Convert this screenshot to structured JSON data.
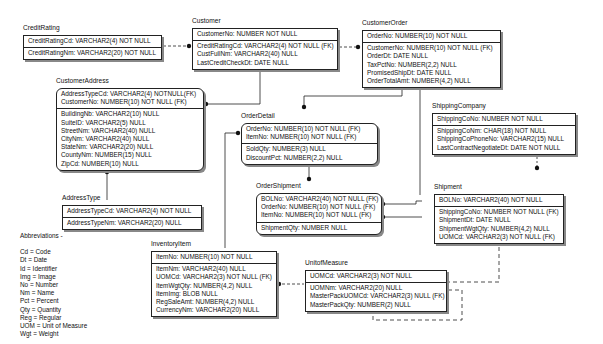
{
  "diagram": {
    "type": "entity-relationship",
    "entities": {
      "credit_rating": {
        "name": "CreditRating",
        "keys": [
          "CreditRatingCd: VARCHAR2(4) NOT NULL"
        ],
        "attributes": [
          "CreditRatingNm: VARCHAR2(20) NOT NULL"
        ]
      },
      "customer": {
        "name": "Customer",
        "keys": [
          "CustomerNo: NUMBER NOT NULL"
        ],
        "attributes": [
          "CreditRatingCd: VARCHAR2(4) NOT NULL (FK)",
          "CustFullNm: VARCHAR2(40) NULL",
          "LastCreditCheckDt: DATE NULL"
        ]
      },
      "customer_order": {
        "name": "CustomerOrder",
        "keys": [
          "OrderNo: NUMBER(10) NOT NULL"
        ],
        "attributes": [
          "CustomerNo: NUMBER(10) NOT NULL (FK)",
          "OrderDt: DATE NULL",
          "TaxPctNo: NUMBER(2,2) NULL",
          "PromisedShipDt: DATE NULL",
          "OrderTotalAmt: NUMBER(4,2) NULL"
        ]
      },
      "customer_address": {
        "name": "CustomerAddress",
        "keys": [
          "AddressTypeCd: VARCHAR2(4) NOTNULL(FK)",
          "CustomerNo: NUMBER(10) NOT NULL (FK)"
        ],
        "attributes": [
          "BuildingNb: VARCHAR2(10) NULL",
          "SuiteID: VARCHAR2(5) NULL",
          "StreetNm: VARCHAR2(40) NULL",
          "CityNm: VARCHAR2(40) NULL",
          "StateNm: VARCHAR2(20) NULL",
          "CountyNm: NUMBER(15) NULL",
          "ZipCd: NUMBER(10) NULL"
        ]
      },
      "order_detail": {
        "name": "OrderDetail",
        "keys": [
          "OrderNo: NUMBER(10) NOT NULL (FK)",
          "ItemNo: NUMBER(10) NOT NULL (FK)"
        ],
        "attributes": [
          "SoldQty: NUMBER(3) NULL",
          "DiscountPct: NUMBER(2,2) NULL"
        ]
      },
      "shipping_company": {
        "name": "ShippingCompany",
        "keys": [
          "ShippingCoNo: NUMBER NOT NULL"
        ],
        "attributes": [
          "ShippingCoNm: CHAR(18) NOT NULL",
          "ShippingCoPhoneNo: VARCHAR2(15) NULL",
          "LastContractNegotiateDt: DATE NOT NULL"
        ]
      },
      "address_type": {
        "name": "AddressType",
        "keys": [
          "AddressTypeCd: VARCHAR2(4) NOT NULL"
        ],
        "attributes": [
          "AddressTypeNm: VARCHAR2(20) NULL"
        ]
      },
      "order_shipment": {
        "name": "OrderShipment",
        "keys": [
          "BOLNo: VARCHAR2(40) NOT NULL (FK)",
          "OrderNo: NUMBER(10) NOT NULL (FK)",
          "ItemNo: NUMBER(10) NOT NULL (FK)"
        ],
        "attributes": [
          "ShipmentQty: NUMBER NULL"
        ]
      },
      "shipment": {
        "name": "Shipment",
        "keys": [
          "BOLNo: VARCHAR2(40) NOT NULL"
        ],
        "attributes": [
          "ShippingCoNo: NUMBER NOT NULL (FK)",
          "ShipmentDt: DATE NULL",
          "ShipmentWgtQty: NUMBER(4,2) NULL",
          "UOMCd: VARCHAR2(3) NOT NULL (FK)"
        ]
      },
      "inventory_item": {
        "name": "InventoryItem",
        "keys": [
          "ItemNo: NUMBER(10) NOT NULL"
        ],
        "attributes": [
          "ItemNm: VARCHAR2(40) NULL",
          "UOMCd: VARCHAR2(3) NOT NULL (FK)",
          "ItemWgtQty: NUMBER(4,2) NULL",
          "ItemImg: BLOB NULL",
          "RegSaleAmt: NUMBER(4,2) NULL",
          "CurrencyNm: VARCHAR2(20) NULL"
        ]
      },
      "unit_of_measure": {
        "name": "UnitofMeasure",
        "keys": [
          "UOMCd: VARCHAR2(3) NOT NULL"
        ],
        "attributes": [
          "UOMNm: VARCHAR2(20) NULL",
          "MasterPackUOMCd: VARCHAR2(3) NULL (FK)",
          "MasterPackQty: NUMBER(2) NULL"
        ]
      }
    },
    "abbreviations": {
      "title": "Abbreviations -",
      "items": [
        "Cd = Code",
        "Dt = Date",
        "Id = Identifier",
        "Img = Image",
        "No = Number",
        "Nm = Name",
        "Pct = Percent",
        "Qty = Quantity",
        "Reg = Regular",
        "UOM = Unit of Measure",
        "Wgt = Weight"
      ]
    },
    "colors": {
      "line": "#222222",
      "shadow": "#888888",
      "background": "#ffffff"
    }
  }
}
